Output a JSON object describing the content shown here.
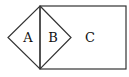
{
  "diagram": {
    "labels": {
      "a": "A",
      "b": "B",
      "c": "C"
    },
    "colors": {
      "stroke": "#333333",
      "background": "#ffffff"
    }
  }
}
